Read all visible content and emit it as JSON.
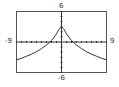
{
  "chart_data": {
    "type": "line",
    "title": "",
    "xlabel": "",
    "ylabel": "",
    "xlim": [
      -9,
      9
    ],
    "ylim": [
      -6,
      6
    ],
    "tick_labels": {
      "x_min": "-9",
      "x_max": "9",
      "y_min": "-6",
      "y_max": "6"
    },
    "grid": false,
    "tick_marks": "unit ticks along both axes",
    "series": [
      {
        "name": "f(x)",
        "x": [
          -9,
          -8,
          -7,
          -6,
          -5,
          -4,
          -3,
          -2,
          -1,
          -0.5,
          0,
          0.5,
          1,
          2,
          3,
          4,
          5,
          6,
          7,
          8,
          9
        ],
        "values": [
          -3.5,
          -3.2,
          -2.8,
          -2.4,
          -1.9,
          -1.3,
          -0.6,
          0.3,
          1.6,
          2.5,
          3.0,
          2.5,
          1.6,
          0.3,
          -0.6,
          -1.3,
          -1.9,
          -2.4,
          -2.8,
          -3.2,
          -3.5
        ]
      }
    ]
  },
  "labels": {
    "x_min": "-9",
    "x_max": "9",
    "y_min": "-6",
    "y_max": "6"
  },
  "colors": {
    "curve": "#333333",
    "frame": "#555555",
    "axis": "#333333"
  }
}
